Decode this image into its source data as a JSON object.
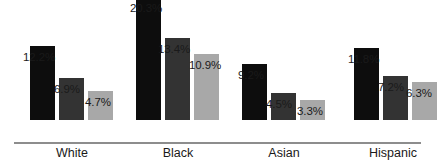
{
  "chart_data": {
    "type": "bar",
    "title": "",
    "xlabel": "",
    "ylabel": "",
    "ylim": [
      0,
      21
    ],
    "grid": false,
    "legend": "none",
    "categories": [
      "White",
      "Black",
      "Asian",
      "Hispanic"
    ],
    "series": [
      {
        "name": "series-1",
        "color": "#0d0d0d",
        "values": [
          12.2,
          20.3,
          9.2,
          11.8
        ],
        "labels": [
          "12.2%",
          "20.3%",
          "9.2%",
          "11.8%"
        ]
      },
      {
        "name": "series-2",
        "color": "#333333",
        "values": [
          6.9,
          13.4,
          4.5,
          7.2
        ],
        "labels": [
          "6.9%",
          "13.4%",
          "4.5%",
          "7.2%"
        ]
      },
      {
        "name": "series-3",
        "color": "#a8a8a8",
        "values": [
          4.7,
          10.9,
          3.3,
          6.3
        ],
        "labels": [
          "4.7%",
          "10.9%",
          "3.3%",
          "6.3%"
        ]
      }
    ]
  },
  "axis": {
    "baseline_color": "#8d8d8d"
  },
  "geometry": {
    "baseline_y": 143,
    "px_per_unit": 6.1,
    "bar_width": 25,
    "groups_x": [
      30,
      147,
      252,
      364
    ],
    "bar_gap": 4
  }
}
